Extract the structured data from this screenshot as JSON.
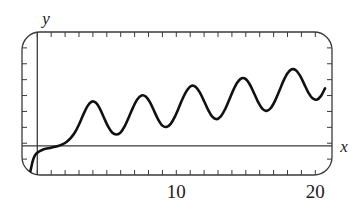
{
  "figure": {
    "title": "",
    "frame_style": "rounded-rectangle",
    "background_color": "#ffffff",
    "curve_color": "#111111",
    "axis_color": "#3a3a3a",
    "frame_color": "#3a3a3a"
  },
  "labels": {
    "x_axis": "x",
    "y_axis": "y"
  },
  "chart_data": {
    "type": "line",
    "title": "",
    "xlabel": "x",
    "ylabel": "y",
    "xlim": [
      -1.1,
      21.2
    ],
    "ylim": [
      -2.6,
      10.2
    ],
    "grid": false,
    "legend": "none",
    "xticks": [
      0,
      1,
      2,
      3,
      4,
      5,
      6,
      7,
      8,
      9,
      10,
      11,
      12,
      13,
      14,
      15,
      16,
      17,
      18,
      19,
      20
    ],
    "xtick_labels": [
      "10",
      "20"
    ],
    "xtick_label_values": [
      10,
      20
    ],
    "ytick_count": 8,
    "ytick_labels": [],
    "series": [
      {
        "name": "curve",
        "description": "oscillation with growing amplitude rising from below the x-axis",
        "x": [
          -0.55,
          -0.45,
          -0.35,
          -0.25,
          -0.1,
          0.1,
          0.35,
          0.6,
          0.9,
          1.2,
          1.5,
          1.8,
          2.1,
          2.4,
          2.7,
          3.0,
          3.3,
          3.6,
          3.9,
          4.2,
          4.5,
          4.8,
          5.1,
          5.4,
          5.7,
          6.0,
          6.3,
          6.6,
          6.9,
          7.2,
          7.5,
          7.8,
          8.1,
          8.4,
          8.7,
          9.0,
          9.3,
          9.6,
          9.9,
          10.2,
          10.5,
          10.8,
          11.1,
          11.4,
          11.7,
          12.0,
          12.3,
          12.6,
          12.9,
          13.2,
          13.5,
          13.8,
          14.1,
          14.4,
          14.7,
          15.0,
          15.3,
          15.6,
          15.9,
          16.2,
          16.5,
          16.8,
          17.1,
          17.4,
          17.7,
          18.0,
          18.3,
          18.6,
          18.9,
          19.2,
          19.5,
          19.8,
          20.1,
          20.4,
          20.7
        ],
        "y": [
          -2.55,
          -2.0,
          -1.45,
          -1.05,
          -0.72,
          -0.52,
          -0.36,
          -0.26,
          -0.18,
          -0.1,
          0.0,
          0.14,
          0.36,
          0.7,
          1.2,
          1.92,
          2.78,
          3.54,
          3.96,
          3.88,
          3.34,
          2.52,
          1.72,
          1.18,
          1.02,
          1.22,
          1.8,
          2.62,
          3.48,
          4.18,
          4.52,
          4.42,
          3.92,
          3.14,
          2.36,
          1.82,
          1.7,
          1.98,
          2.62,
          3.48,
          4.36,
          5.04,
          5.38,
          5.28,
          4.78,
          4.0,
          3.2,
          2.6,
          2.4,
          2.64,
          3.26,
          4.12,
          5.0,
          5.7,
          6.06,
          5.98,
          5.48,
          4.7,
          3.9,
          3.32,
          3.14,
          3.4,
          4.04,
          4.9,
          5.8,
          6.5,
          6.86,
          6.78,
          6.3,
          5.54,
          4.78,
          4.26,
          4.14,
          4.46,
          5.16
        ]
      }
    ]
  }
}
